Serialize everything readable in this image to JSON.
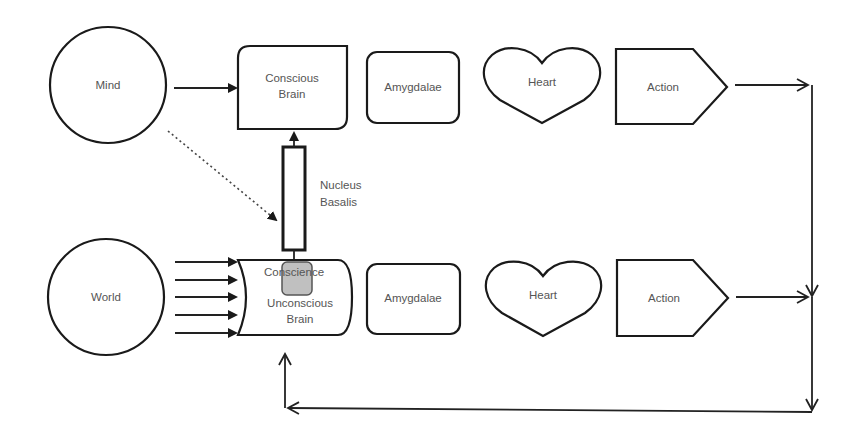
{
  "diagram": {
    "colors": {
      "stroke": "#1a1a1a",
      "text": "#555555",
      "conscience_fill": "#c0c0c0",
      "background": "#ffffff"
    },
    "top_row": {
      "source": {
        "label": "Mind"
      },
      "brain": {
        "line1": "Conscious",
        "line2": "Brain"
      },
      "amygdalae": {
        "label": "Amygdalae"
      },
      "heart": {
        "label": "Heart"
      },
      "action": {
        "label": "Action"
      }
    },
    "bottom_row": {
      "source": {
        "label": "World"
      },
      "brain": {
        "line1": "Unconscious",
        "line2": "Brain"
      },
      "conscience": {
        "label": "Conscience"
      },
      "amygdalae": {
        "label": "Amygdalae"
      },
      "heart": {
        "label": "Heart"
      },
      "action": {
        "label": "Action"
      }
    },
    "connector": {
      "nucleus_basalis": {
        "line1": "Nucleus",
        "line2": "Basalis"
      }
    },
    "world_input_arrows": 5
  }
}
